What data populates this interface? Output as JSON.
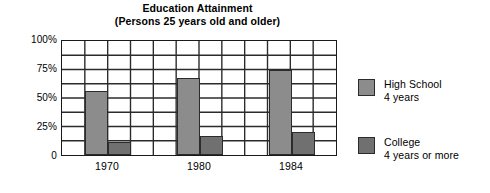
{
  "chart_data": {
    "type": "bar",
    "title": "Education Attainment",
    "subtitle": "(Persons 25 years old and older)",
    "xlabel": "",
    "ylabel": "",
    "categories": [
      "1970",
      "1980",
      "1984"
    ],
    "series": [
      {
        "name": "High School 4 years",
        "name_line1": "High School",
        "name_line2": "4 years",
        "color": "#8c8c8c",
        "values": [
          55,
          66,
          73
        ]
      },
      {
        "name": "College 4 years or more",
        "name_line1": "College",
        "name_line2": "4 years or more",
        "color": "#707070",
        "values": [
          11,
          16,
          20
        ]
      }
    ],
    "ylim": [
      0,
      100
    ],
    "y_ticks": [
      "0",
      "25%",
      "50%",
      "75%",
      "100%"
    ],
    "y_tick_values": [
      0,
      25,
      50,
      75,
      100
    ],
    "grid": true,
    "gridline_interval": 12.5,
    "legend_position": "right",
    "value_unit": "%"
  }
}
